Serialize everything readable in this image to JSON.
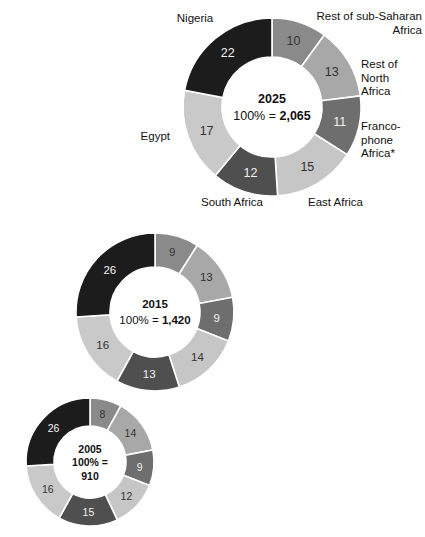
{
  "figure": {
    "title_fragment": "",
    "footnote_marker": "*",
    "background": "#ffffff"
  },
  "palette": {
    "rest_sub_saharan": "#8a8a8a",
    "rest_north_africa": "#a8a8a8",
    "francophone": "#6e6e6e",
    "east_africa": "#c6c6c6",
    "south_africa": "#4f4f4f",
    "egypt": "#c9c9c9",
    "nigeria": "#1c1c1c",
    "divider": "#ffffff",
    "value_text": "#333333",
    "value_text_on_dark": "#f2f2f2",
    "center_text": "#111111"
  },
  "labels": {
    "nigeria": "Nigeria",
    "rest_sub_saharan": "Rest of sub-Saharan\nAfrica",
    "rest_north_africa": "Rest of\nNorth\nAfrica",
    "francophone": "Franco-\nphone\nAfrica*",
    "east_africa": "East Africa",
    "south_africa": "South Africa",
    "egypt": "Egypt"
  },
  "chart_data": {
    "type": "pie",
    "variant": "donut",
    "title": "",
    "unit": "percent of total",
    "legend_position": "callout-labels-on-first-chart",
    "categories": [
      "Rest of sub-Saharan Africa",
      "Rest of North Africa",
      "Francophone Africa*",
      "East Africa",
      "South Africa",
      "Egypt",
      "Nigeria"
    ],
    "colors": [
      "#8a8a8a",
      "#a8a8a8",
      "#6e6e6e",
      "#c6c6c6",
      "#4f4f4f",
      "#c9c9c9",
      "#1c1c1c"
    ],
    "charts": [
      {
        "id": "donut-2025",
        "year": "2025",
        "total_label": "100% = ",
        "total_value": "2,065",
        "total_lines": [
          "2025",
          "100% = 2,065"
        ],
        "values": [
          10,
          13,
          11,
          15,
          12,
          17,
          22
        ],
        "labeled": true
      },
      {
        "id": "donut-2015",
        "year": "2015",
        "total_label": "100% = ",
        "total_value": "1,420",
        "total_lines": [
          "2015",
          "100% = 1,420"
        ],
        "values": [
          9,
          13,
          9,
          14,
          13,
          16,
          26
        ],
        "labeled": false
      },
      {
        "id": "donut-2005",
        "year": "2005",
        "total_label": "100% = ",
        "total_value": "910",
        "total_lines": [
          "2005",
          "100% =",
          "910"
        ],
        "values": [
          8,
          14,
          9,
          12,
          15,
          16,
          26
        ],
        "labeled": false
      }
    ]
  }
}
